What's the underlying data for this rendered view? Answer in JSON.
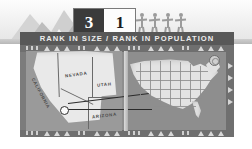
{
  "page": {
    "title": "RANK IN SIZE / RANK IN POPULATION",
    "accent_dark": "#3b3b3b",
    "accent_banner": "#585858",
    "panel_bg": "#8e8e8e"
  },
  "ranks": {
    "size_label": "3",
    "population_label": "1",
    "size_box_bg": "#3b3b3b",
    "population_box_bg": "#fdfdfd"
  },
  "banner": {
    "text": "RANK IN SIZE / RANK IN POPULATION"
  },
  "icons": {
    "mountain": "mountain-icon",
    "people": "people-holding-hands-icon",
    "seal": "compass-seal-icon",
    "marker": "location-marker-icon"
  },
  "people": {
    "count": 4,
    "alt": "four human figures holding hands"
  },
  "mountains": {
    "count": 4,
    "alt": "mountain range silhouette"
  },
  "inset_map": {
    "name": "western-states-inset",
    "states": [
      {
        "label": "CALIFORNIA"
      },
      {
        "label": "NEVADA"
      },
      {
        "label": "UTAH"
      },
      {
        "label": "ARIZONA"
      }
    ]
  },
  "national_map": {
    "name": "united-states-map",
    "alt": "map of the contiguous United States with state outlines"
  }
}
